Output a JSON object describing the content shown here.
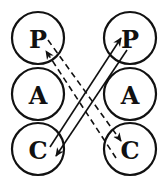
{
  "diagram": {
    "type": "transactional-analysis-crossed-transaction",
    "left_person": {
      "states": [
        {
          "id": "P",
          "label": "P"
        },
        {
          "id": "A",
          "label": "A"
        },
        {
          "id": "C",
          "label": "C"
        }
      ]
    },
    "right_person": {
      "states": [
        {
          "id": "P",
          "label": "P"
        },
        {
          "id": "A",
          "label": "A"
        },
        {
          "id": "C",
          "label": "C"
        }
      ]
    },
    "transactions": [
      {
        "from": "left.C",
        "to": "right.P",
        "style": "solid"
      },
      {
        "from": "right.P",
        "to": "left.C",
        "style": "solid"
      },
      {
        "from": "left.P",
        "to": "right.C",
        "style": "dashed"
      },
      {
        "from": "right.C",
        "to": "left.P",
        "style": "dashed"
      }
    ],
    "colors": {
      "ink": "#111111",
      "background": "#ffffff"
    }
  }
}
